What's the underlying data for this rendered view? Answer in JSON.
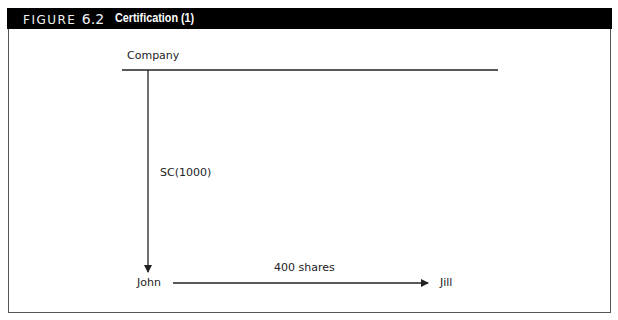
{
  "figure": {
    "number_prefix": "FIGURE",
    "number": "6.2",
    "title": "Certification (1)"
  },
  "diagram": {
    "nodes": {
      "company": "Company",
      "john": "John",
      "jill": "Jill"
    },
    "edges": [
      {
        "from": "company",
        "to": "john",
        "label": "SC(1000)"
      },
      {
        "from": "john",
        "to": "jill",
        "label": "400 shares"
      }
    ]
  },
  "colors": {
    "header_bg": "#000000",
    "header_text": "#ffffff",
    "line": "#222222"
  }
}
